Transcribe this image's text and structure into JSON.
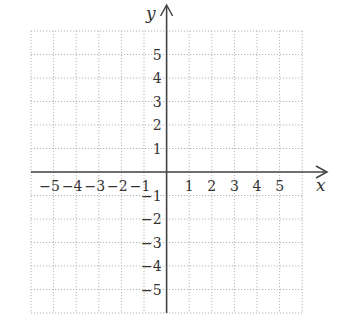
{
  "chart_data": {
    "type": "scatter",
    "title": "",
    "xlabel": "x",
    "ylabel": "y",
    "xlim": [
      -6,
      6
    ],
    "ylim": [
      -6,
      6
    ],
    "grid": true,
    "grid_style": "dotted",
    "x_ticks": [
      -5,
      -4,
      -3,
      -2,
      -1,
      1,
      2,
      3,
      4,
      5
    ],
    "y_ticks": [
      -5,
      -4,
      -3,
      -2,
      -1,
      1,
      2,
      3,
      4,
      5
    ],
    "x_tick_labels": [
      "−5",
      "−4",
      "−3",
      "−2",
      "−1",
      "1",
      "2",
      "3",
      "4",
      "5"
    ],
    "y_tick_labels": [
      "−5",
      "−4",
      "−3",
      "−2",
      "−1",
      "1",
      "2",
      "3",
      "4",
      "5"
    ],
    "series": [],
    "legend": null
  },
  "colors": {
    "axis": "#444444",
    "grid": "#b5b5b5",
    "text": "#333333",
    "background": "#ffffff"
  },
  "layout": {
    "origin_px": [
      166.6,
      172
    ],
    "unit_px_x": 22.6,
    "unit_px_y": 23.5,
    "grid_extent_units": 6
  }
}
